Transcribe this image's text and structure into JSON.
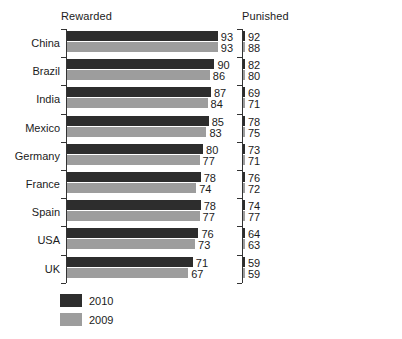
{
  "chart_data": {
    "type": "bar",
    "title": "",
    "subtitle": "",
    "orientation": "horizontal",
    "grid": false,
    "legend_position": "bottom-left",
    "categories": [
      "China",
      "Brazil",
      "India",
      "Mexico",
      "Germany",
      "France",
      "Spain",
      "USA",
      "UK"
    ],
    "panels": [
      {
        "label": "Rewarded",
        "xlabel": "",
        "ylabel": "",
        "axis_note": "bars truncated, axis does not start at zero",
        "series": [
          {
            "name": "2010",
            "color": "#2d2d2d",
            "values": [
              93,
              90,
              87,
              85,
              80,
              78,
              78,
              76,
              71
            ]
          },
          {
            "name": "2009",
            "color": "#9d9d9d",
            "values": [
              93,
              86,
              84,
              83,
              77,
              74,
              77,
              73,
              67
            ]
          }
        ]
      },
      {
        "label": "Punished",
        "xlabel": "",
        "ylabel": "",
        "axis_note": "bars truncated, axis does not start at zero",
        "series": [
          {
            "name": "2010",
            "color": "#2d2d2d",
            "values": [
              92,
              82,
              69,
              78,
              73,
              76,
              74,
              64,
              59
            ]
          },
          {
            "name": "2009",
            "color": "#9d9d9d",
            "values": [
              88,
              80,
              71,
              75,
              71,
              72,
              77,
              63,
              59
            ]
          }
        ]
      }
    ],
    "legend": [
      {
        "name": "2010",
        "color": "#2d2d2d"
      },
      {
        "name": "2009",
        "color": "#9d9d9d"
      }
    ]
  },
  "render": {
    "panel_geometry": [
      {
        "axis_x": 66,
        "scale_px_per_unit": 1.1364,
        "zero_x": -39.7
      },
      {
        "axis_x": 242,
        "scale_px_per_unit": 1.7273,
        "zero_x": 140.1
      }
    ],
    "plot_top": 29,
    "row_pitch": 28.2,
    "bar_height": 10,
    "bar_gap": 1
  }
}
